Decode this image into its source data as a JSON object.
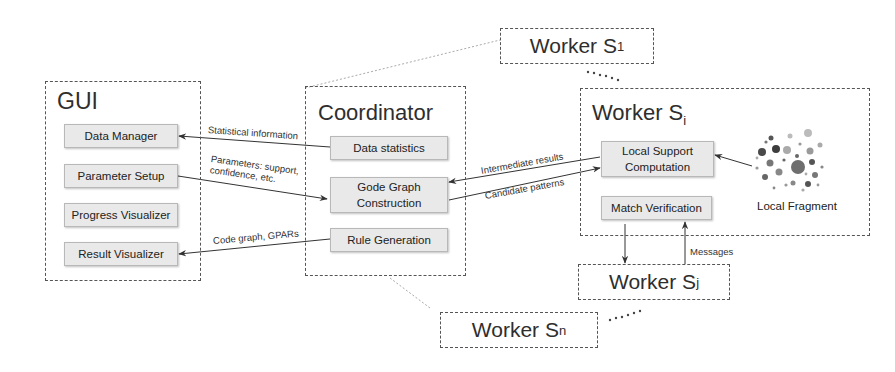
{
  "gui": {
    "title": "GUI",
    "modules": [
      "Data Manager",
      "Parameter Setup",
      "Progress Visualizer",
      "Result Visualizer"
    ]
  },
  "coordinator": {
    "title": "Coordinator",
    "modules": [
      "Data statistics",
      "Gode Graph Construction",
      "Rule Generation"
    ],
    "module_lines": {
      "construction_1": "Gode Graph",
      "construction_2": "Construction"
    }
  },
  "worker_i": {
    "title": "Worker S",
    "subscript": "i",
    "modules": {
      "local_support_1": "Local Support",
      "local_support_2": "Computation",
      "match_verification": "Match Verification"
    },
    "fragment_label": "Local Fragment"
  },
  "workers": {
    "s1": {
      "title": "Worker S",
      "subscript": "1"
    },
    "sj": {
      "title": "Worker S",
      "subscript": "j"
    },
    "sn": {
      "title": "Worker S",
      "subscript": "n"
    }
  },
  "edges": {
    "statistical_information": "Statistical information",
    "parameters_1": "Parameters: support,",
    "parameters_2": "confidence, etc.",
    "code_graph": "Code graph, GPARs",
    "intermediate_results": "Intermediate results",
    "candidate_patterns": "Candidate patterns",
    "messages": "Messages"
  }
}
